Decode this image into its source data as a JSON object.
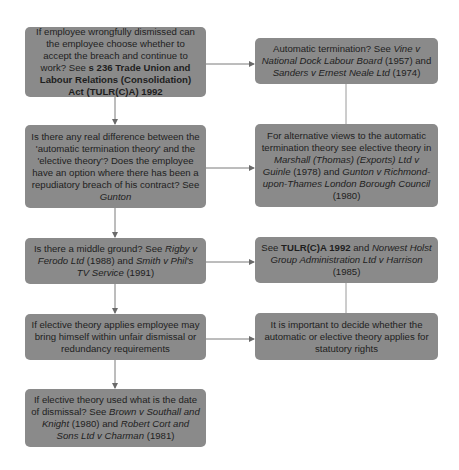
{
  "diagram": {
    "left": [
      {
        "id": "L1",
        "parts": [
          {
            "t": "If employee wrongfully dismissed can the employee choose whether to accept the breach and continue to work? See ",
            "s": ""
          },
          {
            "t": "s 236 Trade Union and Labour Relations (Consolidation) Act (TULR(C)A) 1992",
            "s": "b"
          }
        ]
      },
      {
        "id": "L2",
        "parts": [
          {
            "t": "Is there any real difference between the 'automatic termination theory' and the 'elective theory'? Does the employee have an option where there has been a repudiatory breach of his contract? See ",
            "s": ""
          },
          {
            "t": "Gunton",
            "s": "i"
          }
        ]
      },
      {
        "id": "L3",
        "parts": [
          {
            "t": "Is there a middle ground?  See ",
            "s": ""
          },
          {
            "t": "Rigby v Ferodo Ltd",
            "s": "i"
          },
          {
            "t": " (1988) and ",
            "s": ""
          },
          {
            "t": "Smith v Phil's TV Service",
            "s": "i"
          },
          {
            "t": " (1991)",
            "s": ""
          }
        ]
      },
      {
        "id": "L4",
        "parts": [
          {
            "t": "If elective theory applies employee may bring himself within unfair dismissal or redundancy requirements",
            "s": ""
          }
        ]
      },
      {
        "id": "L5",
        "parts": [
          {
            "t": "If elective theory used what is the date of dismissal? See ",
            "s": ""
          },
          {
            "t": "Brown v Southall and Knight",
            "s": "i"
          },
          {
            "t": " (1980) and ",
            "s": ""
          },
          {
            "t": "Robert Cort and Sons Ltd v Charman",
            "s": "i"
          },
          {
            "t": " (1981)",
            "s": ""
          }
        ]
      }
    ],
    "right": [
      {
        "id": "R1",
        "parts": [
          {
            "t": "Automatic termination? See ",
            "s": ""
          },
          {
            "t": "Vine v National Dock Labour Board",
            "s": "i"
          },
          {
            "t": " (1957) and ",
            "s": ""
          },
          {
            "t": "Sanders v Ernest Neale Ltd",
            "s": "i"
          },
          {
            "t": " (1974)",
            "s": ""
          }
        ]
      },
      {
        "id": "R2",
        "parts": [
          {
            "t": "For alternative views to the automatic termination theory see  elective theory in ",
            "s": ""
          },
          {
            "t": "Marshall (Thomas) (Exports) Ltd v Guinle",
            "s": "i"
          },
          {
            "t": " (1978) and ",
            "s": ""
          },
          {
            "t": "Gunton v Richmond-upon-Thames London Borough Council",
            "s": "i"
          },
          {
            "t": " (1980)",
            "s": ""
          }
        ]
      },
      {
        "id": "R3",
        "parts": [
          {
            "t": "See ",
            "s": ""
          },
          {
            "t": "TULR(C)A 1992",
            "s": "b"
          },
          {
            "t": " and ",
            "s": ""
          },
          {
            "t": "Norwest Holst Group Administration Ltd v Harrison",
            "s": "i"
          },
          {
            "t": " (1985)",
            "s": ""
          }
        ]
      },
      {
        "id": "R4",
        "parts": [
          {
            "t": "It is important to decide whether the automatic or elective theory applies for statutory  rights",
            "s": ""
          }
        ]
      }
    ],
    "colors": {
      "box": "#8a8a8a",
      "text": "#1e1e1e",
      "line": "#7a7a7a",
      "background": "#ffffff"
    }
  }
}
